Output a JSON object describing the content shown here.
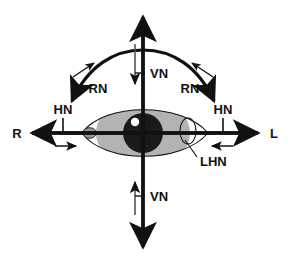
{
  "diagram": {
    "type": "anatomical-schematic",
    "background_color": "#ffffff",
    "stroke_color": "#111111",
    "iris_color": "#b3b3b3",
    "pupil_color": "#1a1a1a",
    "highlight_color": "#ffffff",
    "caruncle_color": "#9a9a9a"
  },
  "axes": {
    "horizontal": {
      "left_label": "R",
      "right_label": "L",
      "left_tip_x": 28,
      "right_tip_x": 262,
      "y": 133
    },
    "vertical": {
      "top_tip_y": 13,
      "bottom_tip_y": 251,
      "x": 143
    }
  },
  "labels": {
    "right_axis_end": "R",
    "left_axis_end": "L",
    "horizontal_nystagmus_left": "HN",
    "horizontal_nystagmus_right": "HN",
    "vertical_nystagmus_up": "VN",
    "vertical_nystagmus_down": "VN",
    "rotary_nystagmus_left": "RN",
    "rotary_nystagmus_right": "RN",
    "latent_horizontal_nystagmus": "LHN"
  },
  "markers": {
    "hn_tick_left_x": 63,
    "hn_tick_right_x": 223,
    "vn_tick_up_y": 73,
    "vn_tick_down_y": 196
  },
  "eye": {
    "outline_left_x": 82,
    "outline_right_x": 208,
    "center_x": 143,
    "center_y": 133,
    "iris_radius_x": 47,
    "iris_radius_y": 33,
    "pupil_radius": 20
  }
}
